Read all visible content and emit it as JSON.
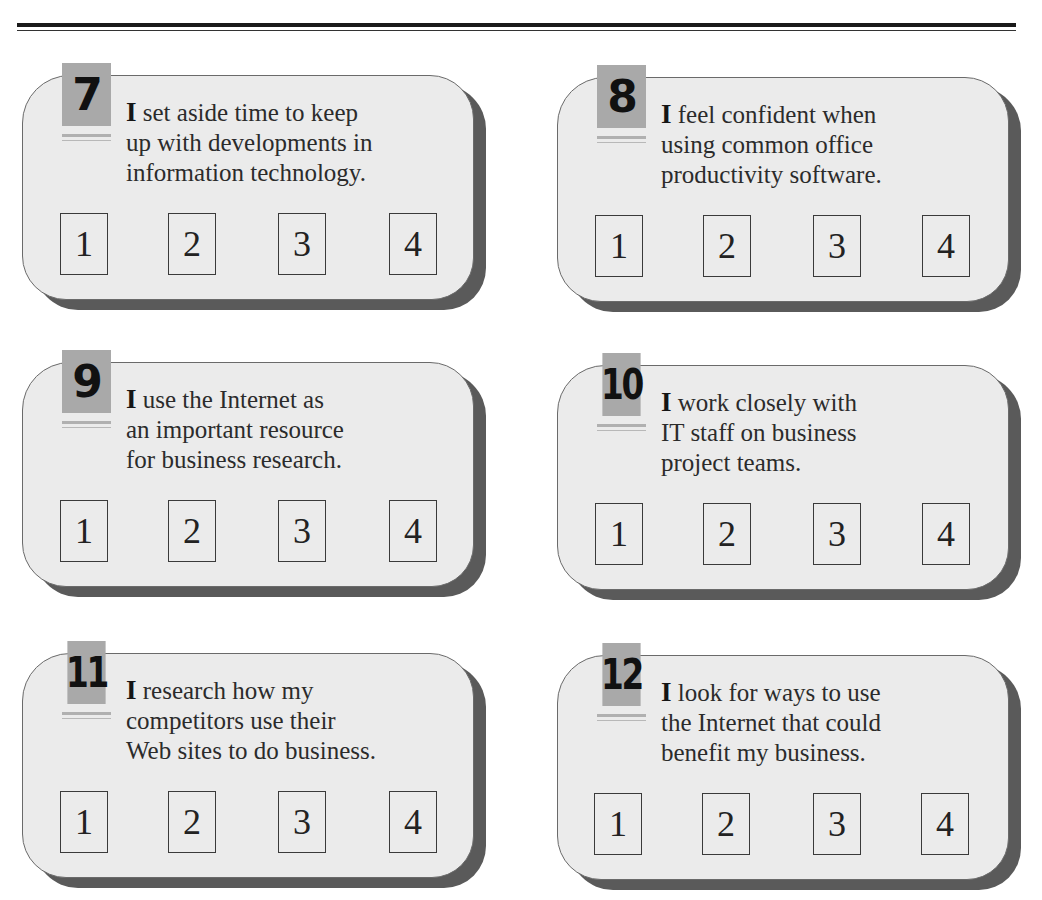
{
  "cards": [
    {
      "number": "7",
      "lead": "I",
      "lines": [
        " set aside time to keep",
        "up with developments in",
        "information technology."
      ],
      "options": [
        "1",
        "2",
        "3",
        "4"
      ]
    },
    {
      "number": "8",
      "lead": "I",
      "lines": [
        " feel confident when",
        "using common office",
        "productivity software."
      ],
      "options": [
        "1",
        "2",
        "3",
        "4"
      ]
    },
    {
      "number": "9",
      "lead": "I",
      "lines": [
        " use the Internet as",
        "an important resource",
        "for business research."
      ],
      "options": [
        "1",
        "2",
        "3",
        "4"
      ]
    },
    {
      "number": "10",
      "lead": "I",
      "lines": [
        " work closely with",
        "IT staff on business",
        "project teams."
      ],
      "options": [
        "1",
        "2",
        "3",
        "4"
      ]
    },
    {
      "number": "11",
      "lead": "I",
      "lines": [
        " research how my",
        "competitors use their",
        "Web sites to do business."
      ],
      "options": [
        "1",
        "2",
        "3",
        "4"
      ]
    },
    {
      "number": "12",
      "lead": "I",
      "lines": [
        " look for ways to use",
        "the Internet that could",
        "benefit my business."
      ],
      "options": [
        "1",
        "2",
        "3",
        "4"
      ]
    }
  ],
  "colors": {
    "card_fill": "#ebebeb",
    "card_shadow": "#5a5a5a",
    "badge_fill": "#a9a9a9",
    "rule": "#1a1a1a"
  }
}
